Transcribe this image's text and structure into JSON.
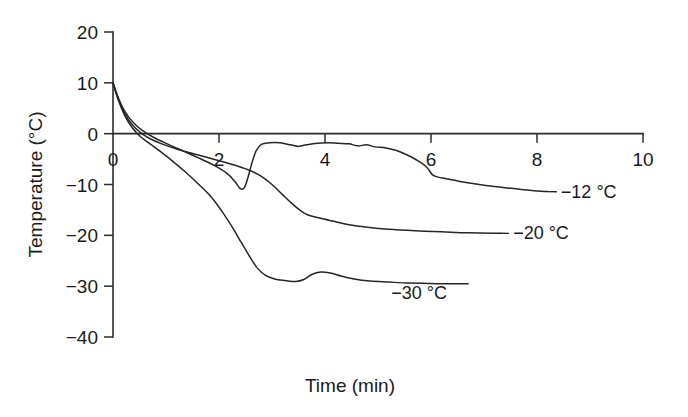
{
  "chart_data": {
    "type": "line",
    "title": "",
    "xlabel": "Time (min)",
    "ylabel": "Temperature (°C)",
    "xlim": [
      0,
      10
    ],
    "ylim": [
      -40,
      20
    ],
    "xticks": [
      0,
      2,
      4,
      6,
      8,
      10
    ],
    "yticks": [
      20,
      10,
      0,
      -10,
      -20,
      -30,
      -40
    ],
    "xtick_labels": [
      "0",
      "2",
      "4",
      "6",
      "8",
      "10"
    ],
    "ytick_labels": [
      "20",
      "10",
      "0",
      "−10",
      "−20",
      "−30",
      "−40"
    ],
    "grid": false,
    "legend_position": "inline-right-of-curve-end",
    "series": [
      {
        "name": "−12 °C",
        "label": "−12 °C",
        "color": "#262626",
        "points": [
          [
            0.0,
            10.0
          ],
          [
            0.08,
            7.6
          ],
          [
            0.18,
            5.2
          ],
          [
            0.3,
            3.2
          ],
          [
            0.45,
            1.5
          ],
          [
            0.6,
            0.3
          ],
          [
            0.78,
            -0.8
          ],
          [
            1.0,
            -1.9
          ],
          [
            1.3,
            -3.3
          ],
          [
            1.6,
            -4.7
          ],
          [
            1.9,
            -6.2
          ],
          [
            2.15,
            -7.8
          ],
          [
            2.3,
            -9.4
          ],
          [
            2.4,
            -10.8
          ],
          [
            2.48,
            -10.6
          ],
          [
            2.55,
            -8.5
          ],
          [
            2.62,
            -5.8
          ],
          [
            2.7,
            -3.4
          ],
          [
            2.8,
            -2.1
          ],
          [
            2.95,
            -1.8
          ],
          [
            3.15,
            -1.8
          ],
          [
            3.35,
            -2.2
          ],
          [
            3.5,
            -2.5
          ],
          [
            3.65,
            -2.2
          ],
          [
            3.85,
            -1.9
          ],
          [
            4.05,
            -1.8
          ],
          [
            4.25,
            -1.9
          ],
          [
            4.45,
            -2.0
          ],
          [
            4.62,
            -2.4
          ],
          [
            4.78,
            -2.2
          ],
          [
            4.95,
            -2.6
          ],
          [
            5.15,
            -2.8
          ],
          [
            5.35,
            -3.3
          ],
          [
            5.55,
            -4.2
          ],
          [
            5.75,
            -5.3
          ],
          [
            5.92,
            -6.6
          ],
          [
            6.02,
            -8.0
          ],
          [
            6.12,
            -8.5
          ],
          [
            6.3,
            -8.9
          ],
          [
            6.55,
            -9.4
          ],
          [
            6.85,
            -9.9
          ],
          [
            7.2,
            -10.4
          ],
          [
            7.55,
            -10.8
          ],
          [
            7.9,
            -11.2
          ],
          [
            8.2,
            -11.4
          ]
        ],
        "label_anchor": [
          8.45,
          -12.6
        ]
      },
      {
        "name": "−20 °C",
        "label": "−20 °C",
        "color": "#262626",
        "points": [
          [
            0.0,
            10.0
          ],
          [
            0.1,
            6.8
          ],
          [
            0.22,
            4.0
          ],
          [
            0.36,
            1.8
          ],
          [
            0.52,
            0.2
          ],
          [
            0.7,
            -1.0
          ],
          [
            0.92,
            -2.0
          ],
          [
            1.2,
            -3.0
          ],
          [
            1.5,
            -3.9
          ],
          [
            1.85,
            -4.9
          ],
          [
            2.2,
            -5.9
          ],
          [
            2.55,
            -7.1
          ],
          [
            2.8,
            -8.4
          ],
          [
            3.0,
            -10.0
          ],
          [
            3.18,
            -11.8
          ],
          [
            3.35,
            -13.5
          ],
          [
            3.52,
            -15.0
          ],
          [
            3.68,
            -16.0
          ],
          [
            3.9,
            -16.6
          ],
          [
            4.15,
            -17.2
          ],
          [
            4.45,
            -17.9
          ],
          [
            4.8,
            -18.4
          ],
          [
            5.2,
            -18.8
          ],
          [
            5.7,
            -19.1
          ],
          [
            6.2,
            -19.3
          ],
          [
            6.7,
            -19.5
          ],
          [
            7.3,
            -19.6
          ]
        ],
        "label_anchor": [
          7.55,
          -20.8
        ]
      },
      {
        "name": "−30 °C",
        "label": "−30 °C",
        "color": "#262626",
        "points": [
          [
            0.0,
            10.0
          ],
          [
            0.1,
            6.6
          ],
          [
            0.22,
            3.6
          ],
          [
            0.36,
            1.2
          ],
          [
            0.52,
            -0.6
          ],
          [
            0.7,
            -2.0
          ],
          [
            0.88,
            -3.4
          ],
          [
            1.1,
            -5.2
          ],
          [
            1.35,
            -7.4
          ],
          [
            1.6,
            -9.8
          ],
          [
            1.85,
            -12.4
          ],
          [
            2.05,
            -15.2
          ],
          [
            2.25,
            -18.4
          ],
          [
            2.42,
            -21.4
          ],
          [
            2.58,
            -24.2
          ],
          [
            2.72,
            -26.4
          ],
          [
            2.88,
            -27.9
          ],
          [
            3.05,
            -28.6
          ],
          [
            3.25,
            -28.9
          ],
          [
            3.45,
            -29.1
          ],
          [
            3.6,
            -28.7
          ],
          [
            3.75,
            -27.7
          ],
          [
            3.92,
            -27.2
          ],
          [
            4.1,
            -27.4
          ],
          [
            4.3,
            -28.0
          ],
          [
            4.55,
            -28.6
          ],
          [
            4.85,
            -29.0
          ],
          [
            5.2,
            -29.2
          ],
          [
            5.6,
            -29.4
          ],
          [
            6.1,
            -29.5
          ],
          [
            6.7,
            -29.5
          ]
        ],
        "label_anchor": [
          5.25,
          -32.6
        ]
      }
    ]
  },
  "axes": {
    "y_axis_title": "Temperature (°C)",
    "x_axis_title": "Time (min)"
  }
}
